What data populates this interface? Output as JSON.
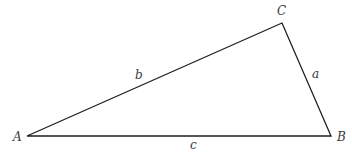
{
  "diagram": {
    "type": "triangle",
    "vertices": {
      "A": {
        "label": "A",
        "x": 27,
        "y": 136,
        "label_x": 13,
        "label_y": 141
      },
      "B": {
        "label": "B",
        "x": 331,
        "y": 136,
        "label_x": 337,
        "label_y": 141
      },
      "C": {
        "label": "C",
        "x": 282,
        "y": 23,
        "label_x": 277,
        "label_y": 15
      }
    },
    "sides": {
      "a": {
        "label": "a",
        "from": "C",
        "to": "B",
        "label_x": 312,
        "label_y": 78
      },
      "b": {
        "label": "b",
        "from": "A",
        "to": "C",
        "label_x": 135,
        "label_y": 79
      },
      "c": {
        "label": "c",
        "from": "A",
        "to": "B",
        "label_x": 190,
        "label_y": 149
      }
    },
    "stroke_color": "#1e1e1e",
    "label_color": "#3a3a3a"
  }
}
